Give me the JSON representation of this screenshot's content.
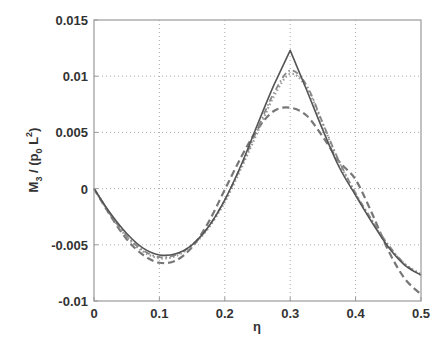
{
  "chart_data": {
    "type": "line",
    "title": "",
    "xlabel": "η",
    "ylabel": "M3 / (p0 L2)",
    "ylabel_parts": {
      "main": "M",
      "sub1": "3",
      "mid": " / (p",
      "sub2": "0",
      "mid2": " L",
      "sup": "2",
      "end": ")"
    },
    "xlim": [
      0,
      0.5
    ],
    "ylim": [
      -0.01,
      0.015
    ],
    "xticks": [
      0,
      0.1,
      0.2,
      0.3,
      0.4,
      0.5
    ],
    "xtick_labels": [
      "0",
      "0.1",
      "0.2",
      "0.3",
      "0.4",
      "0.5"
    ],
    "yticks": [
      -0.01,
      -0.005,
      0,
      0.005,
      0.01,
      0.015
    ],
    "ytick_labels": [
      "-0.01",
      "-0.005",
      "0",
      "0.005",
      "0.01",
      "0.015"
    ],
    "grid": true,
    "legend": null,
    "x": [
      0,
      0.025,
      0.05,
      0.075,
      0.1,
      0.125,
      0.15,
      0.175,
      0.2,
      0.225,
      0.25,
      0.275,
      0.3,
      0.325,
      0.35,
      0.375,
      0.4,
      0.425,
      0.45,
      0.475,
      0.5
    ],
    "series": [
      {
        "name": "solid",
        "style": "solid",
        "color": "#555555",
        "values": [
          0,
          -0.0022,
          -0.004,
          -0.0053,
          -0.0059,
          -0.0058,
          -0.005,
          -0.0034,
          -0.001,
          0.0021,
          0.0057,
          0.0092,
          0.0123,
          0.0088,
          0.0052,
          0.0019,
          -0.0006,
          -0.003,
          -0.0052,
          -0.0068,
          -0.0077
        ]
      },
      {
        "name": "dash-dot",
        "style": "dashdot",
        "color": "#888888",
        "values": [
          0,
          -0.0023,
          -0.0042,
          -0.0055,
          -0.0061,
          -0.0059,
          -0.005,
          -0.0034,
          -0.001,
          0.002,
          0.0053,
          0.0085,
          0.0105,
          0.0092,
          0.0058,
          0.0024,
          -0.0004,
          -0.0028,
          -0.005,
          -0.0067,
          -0.0077
        ]
      },
      {
        "name": "dotted",
        "style": "dotted",
        "color": "#999999",
        "values": [
          0,
          -0.0023,
          -0.0043,
          -0.0056,
          -0.0062,
          -0.006,
          -0.0051,
          -0.0035,
          -0.0012,
          0.0018,
          0.005,
          0.0082,
          0.0102,
          0.009,
          0.0057,
          0.0023,
          -0.0005,
          -0.0029,
          -0.0051,
          -0.0067,
          -0.0076
        ]
      },
      {
        "name": "dashed",
        "style": "dashed",
        "color": "#777777",
        "values": [
          0,
          -0.0024,
          -0.0045,
          -0.0059,
          -0.0066,
          -0.0064,
          -0.0052,
          -0.003,
          -0.0001,
          0.0028,
          0.0053,
          0.0069,
          0.0072,
          0.0065,
          0.0046,
          0.0024,
          0.0008,
          -0.0022,
          -0.0055,
          -0.008,
          -0.0094
        ]
      }
    ]
  },
  "layout": {
    "plot_left": 94,
    "plot_right": 421,
    "plot_top": 20,
    "plot_bottom": 301
  }
}
